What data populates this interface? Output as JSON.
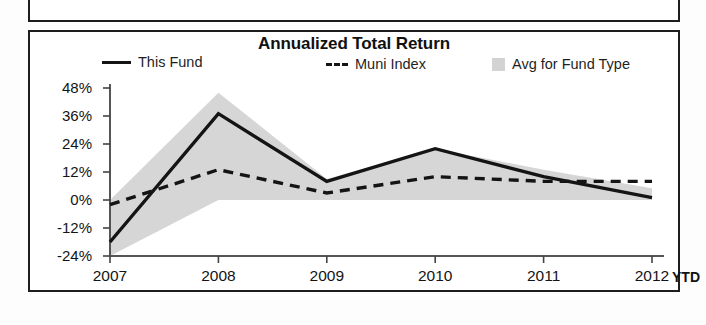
{
  "panel": {
    "title": "Annualized Total Return"
  },
  "legend": {
    "items": [
      {
        "label": "This Fund",
        "marker": "solid-line-swatch",
        "color": "#141414"
      },
      {
        "label": "Muni Index",
        "marker": "dashed-line-swatch",
        "color": "#141414"
      },
      {
        "label": "Avg for Fund Type",
        "marker": "filled-square-swatch",
        "color": "#d3d3d3"
      }
    ]
  },
  "axes": {
    "y_ticks": [
      "48%",
      "36%",
      "24%",
      "12%",
      "0%",
      "-12%",
      "-24%"
    ],
    "x_ticks": [
      "2007",
      "2008",
      "2009",
      "2010",
      "2011",
      "2012"
    ],
    "x_suffix": "YTD"
  },
  "chart_data": {
    "type": "line",
    "title": "Annualized Total Return",
    "xlabel": "",
    "ylabel": "",
    "categories": [
      "2007",
      "2008",
      "2009",
      "2010",
      "2011",
      "2012"
    ],
    "x_axis_note": "2012 value is YTD",
    "ylim": [
      -24,
      48
    ],
    "y_tick_values": [
      48,
      36,
      24,
      12,
      0,
      -12,
      -24
    ],
    "y_tick_labels": [
      "48%",
      "36%",
      "24%",
      "12%",
      "0%",
      "-12%",
      "-24%"
    ],
    "grid": false,
    "legend_position": "top",
    "series": [
      {
        "name": "This Fund",
        "style": "solid",
        "color": "#141414",
        "values": [
          -18,
          37,
          8,
          22,
          10,
          1
        ]
      },
      {
        "name": "Muni Index",
        "style": "dashed",
        "color": "#141414",
        "values": [
          -2,
          13,
          3,
          10,
          8,
          8
        ]
      },
      {
        "name": "Avg for Fund Type",
        "style": "band",
        "color": "#d3d3d3",
        "band_upper": [
          0,
          46,
          9,
          22,
          13,
          5
        ],
        "band_lower": [
          -24,
          0,
          0,
          0,
          0,
          0
        ]
      }
    ]
  }
}
